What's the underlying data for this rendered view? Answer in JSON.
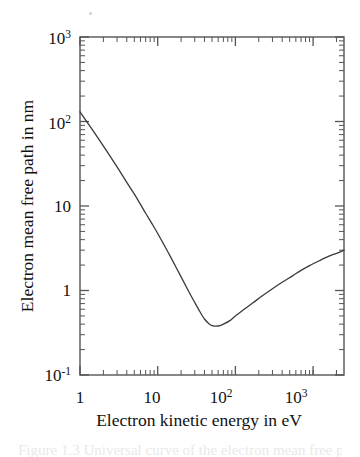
{
  "chart_data": {
    "type": "line",
    "title": "",
    "subtitle": "",
    "xlabel": "Electron kinetic energy in eV",
    "ylabel": "Electron mean free path in nm",
    "xscale": "log",
    "yscale": "log",
    "xlim": [
      1,
      2500
    ],
    "ylim": [
      0.1,
      1000
    ],
    "grid": false,
    "legend": null,
    "x_tick_labels": [
      "1",
      "10",
      "10",
      "10"
    ],
    "x_tick_exponents": [
      "",
      "",
      "2",
      "3"
    ],
    "x_tick_values": [
      1,
      10,
      100,
      1000
    ],
    "y_tick_labels": [
      "10",
      "10",
      "10",
      "1",
      "10"
    ],
    "y_tick_exponents": [
      "3",
      "2",
      "",
      "",
      "-1"
    ],
    "y_tick_values": [
      1000,
      100,
      10,
      1,
      0.1
    ],
    "series": [
      {
        "name": "electron mean free path",
        "color": "#3a3a3a",
        "x": [
          1,
          1.3,
          1.7,
          2.2,
          3,
          4,
          5.5,
          7,
          9,
          12,
          15,
          20,
          25,
          30,
          35,
          40,
          45,
          50,
          60,
          70,
          85,
          100,
          130,
          170,
          220,
          300,
          400,
          550,
          700,
          900,
          1200,
          1600,
          2000,
          2500
        ],
        "y": [
          130,
          92,
          64,
          45,
          29,
          19,
          12,
          8.2,
          5.6,
          3.5,
          2.4,
          1.45,
          0.98,
          0.72,
          0.56,
          0.46,
          0.41,
          0.385,
          0.38,
          0.4,
          0.44,
          0.5,
          0.6,
          0.72,
          0.86,
          1.05,
          1.25,
          1.5,
          1.73,
          1.97,
          2.25,
          2.55,
          2.75,
          3.0
        ]
      }
    ],
    "annotations": [],
    "minimum": {
      "x": 60,
      "y": 0.38
    }
  },
  "figure": {
    "frame_color": "#555555",
    "background": "#ffffff",
    "caption_ghost_text": "Figure 1.3 Universal curve of the electron mean free path"
  }
}
